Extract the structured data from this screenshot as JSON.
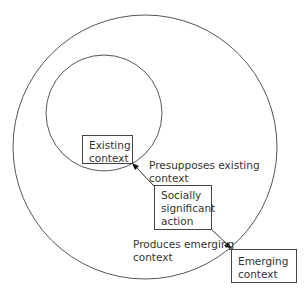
{
  "diagram": {
    "boxes": {
      "existing": "Existing\ncontext",
      "action": "Socially\nsignificant\naction",
      "emerging": "Emerging\ncontext"
    },
    "labels": {
      "presupposes": "Presupposes existing\ncontext",
      "produces": "Produces emerging\ncontext"
    },
    "colors": {
      "stroke": "#444444",
      "text": "#333333"
    }
  }
}
